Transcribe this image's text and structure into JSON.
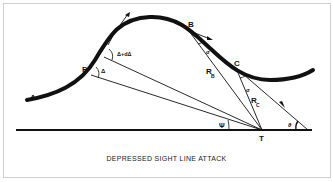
{
  "caption": "DEPRESSED SIGHT LINE ATTACK",
  "points": {
    "A": "A",
    "P": "P",
    "B": "B",
    "C": "C",
    "T": "T"
  },
  "angles": {
    "delta": "Δ",
    "delta_plus": "Δ+dΔ",
    "sigma_b": "σ",
    "sigma_c": "σ",
    "psi": "Ψ",
    "theta": "θ"
  },
  "ranges": {
    "rb_main": "R",
    "rb_sub": "B",
    "rc_main": "R",
    "rc_sub": "C"
  }
}
